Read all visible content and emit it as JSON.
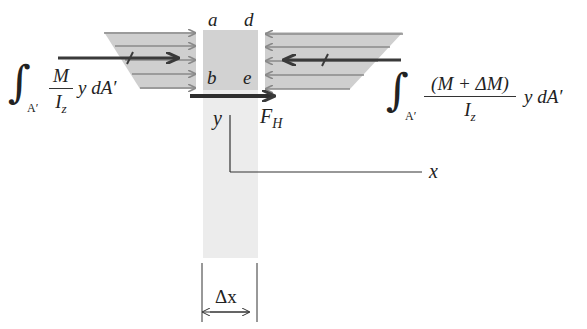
{
  "diagram": {
    "type": "free-body diagram (beam element shear flow)",
    "point_labels": {
      "top_left": "a",
      "top_right": "d",
      "bottom_left": "b",
      "bottom_right": "e"
    },
    "left_expression": {
      "integral_sign": "∫",
      "integral_domain": "A′",
      "numerator": "M",
      "denominator_main": "I",
      "denominator_sub": "z",
      "tail": "y dA′"
    },
    "right_expression": {
      "integral_sign": "∫",
      "integral_domain": "A′",
      "numerator": "(M + ΔM)",
      "denominator_main": "I",
      "denominator_sub": "z",
      "tail": "y dA′"
    },
    "force_label_main": "F",
    "force_label_sub": "H",
    "axis_y_label": "y",
    "axis_x_label": "x",
    "dimension_label": "Δx",
    "colors": {
      "stress_fill": "#c8c8c8",
      "arrow_gray": "#8a8a8a",
      "resultant_dark": "#3a3a3a",
      "beam_fill": "#e6e6e6",
      "element_fill": "#cfcfcf",
      "line": "#333333"
    }
  }
}
